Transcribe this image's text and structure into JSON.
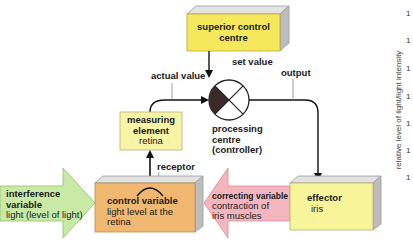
{
  "diagram": {
    "type": "control-loop",
    "nodes": {
      "superior_control_centre": {
        "title": "superior control",
        "title2": "centre"
      },
      "processing_centre": {
        "line1": "processing",
        "line2": "centre",
        "line3": "(controller)"
      },
      "measuring_element": {
        "title": "measuring",
        "title2": "element",
        "subtitle": "retina"
      },
      "control_variable": {
        "title": "control variable",
        "subtitle1": "light level at the",
        "subtitle2": "retina"
      },
      "effector": {
        "title": "effector",
        "subtitle": "iris"
      }
    },
    "arrows": {
      "interference_variable": {
        "title": "interference",
        "title2": "variable",
        "subtitle": "light (level of light)"
      },
      "correcting_variable": {
        "title": "correcting variable",
        "subtitle1": "contraction of",
        "subtitle2": "iris muscles"
      }
    },
    "edge_labels": {
      "set_value": "set value",
      "actual_value": "actual value",
      "output": "output",
      "receptor": "receptor"
    }
  },
  "side_axis": {
    "label": "relative level of light/light intensity",
    "ticks": [
      "1",
      "1",
      "1",
      "1",
      "1",
      "1",
      "1"
    ]
  },
  "colors": {
    "yellow_box": "#f5e85a",
    "light_yellow_box": "#f8f4a6",
    "orange_box": "#f0b870",
    "green_arrow": "#c8eaa6",
    "pink_arrow": "#f4b6be",
    "bevel_grey": "#c9c9c9",
    "line": "#111111"
  }
}
